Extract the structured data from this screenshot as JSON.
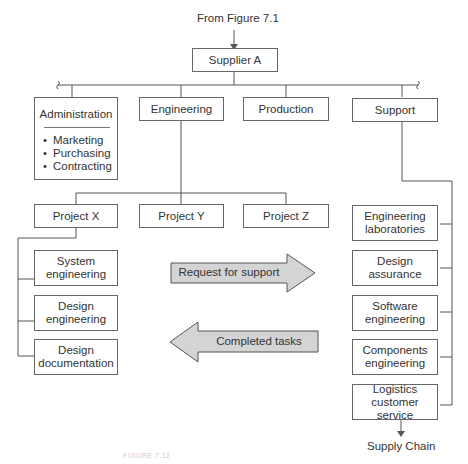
{
  "figure": {
    "source_label": "From Figure 7.1",
    "root": "Supplier A",
    "departments": [
      {
        "label": "Administration",
        "items": [
          "Marketing",
          "Purchasing",
          "Contracting"
        ]
      },
      {
        "label": "Engineering"
      },
      {
        "label": "Production"
      },
      {
        "label": "Support"
      }
    ],
    "projects": [
      "Project X",
      "Project Y",
      "Project Z"
    ],
    "project_x_teams": [
      {
        "line1": "System",
        "line2": "engineering"
      },
      {
        "line1": "Design",
        "line2": "engineering"
      },
      {
        "line1": "Design",
        "line2": "documentation"
      }
    ],
    "support_teams": [
      {
        "line1": "Engineering",
        "line2": "laboratories"
      },
      {
        "line1": "Design",
        "line2": "assurance"
      },
      {
        "line1": "Software",
        "line2": "engineering"
      },
      {
        "line1": "Components",
        "line2": "engineering"
      },
      {
        "line1": "Logistics",
        "line2": "customer service"
      }
    ],
    "arrows": {
      "request": "Request for support",
      "completed": "Completed tasks"
    },
    "output_label": "Supply Chain",
    "caption": "FIGURE 7.12"
  },
  "colors": {
    "line": "#555555",
    "box_border": "#666666",
    "arrow_fill": "#d4d4d4",
    "text": "#333333"
  }
}
